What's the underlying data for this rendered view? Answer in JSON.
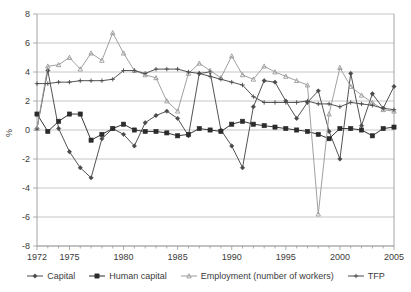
{
  "chart_data": {
    "type": "line",
    "title": "",
    "xlabel": "",
    "ylabel": "%",
    "xlim": [
      1972,
      2005
    ],
    "ylim": [
      -8,
      8
    ],
    "ytick_labels": [
      "8",
      "6",
      "4",
      "2",
      "0",
      "-2",
      "-4",
      "-6",
      "-8"
    ],
    "yticks": [
      8,
      6,
      4,
      2,
      0,
      -2,
      -4,
      -6,
      -8
    ],
    "xtick_labels": [
      "1972",
      "1975",
      "1980",
      "1985",
      "1990",
      "1995",
      "2000",
      "2005"
    ],
    "xticks": [
      1972,
      1975,
      1980,
      1985,
      1990,
      1995,
      2000,
      2005
    ],
    "grid": true,
    "legend_position": "bottom",
    "x": [
      1972,
      1973,
      1974,
      1975,
      1976,
      1977,
      1978,
      1979,
      1980,
      1981,
      1982,
      1983,
      1984,
      1985,
      1986,
      1987,
      1988,
      1989,
      1990,
      1991,
      1992,
      1993,
      1994,
      1995,
      1996,
      1997,
      1998,
      1999,
      2000,
      2001,
      2002,
      2003,
      2004,
      2005
    ],
    "series": [
      {
        "name": "Capital",
        "color": "#4a4a4a",
        "marker": "diamond",
        "values": [
          0.1,
          4.1,
          0.1,
          -1.5,
          -2.6,
          -3.3,
          -0.6,
          0.1,
          -0.3,
          -1.1,
          0.5,
          1.0,
          1.3,
          0.8,
          -0.4,
          3.9,
          4.0,
          0.0,
          -1.1,
          -2.6,
          1.6,
          3.4,
          3.3,
          2.0,
          0.8,
          1.9,
          2.7,
          -0.1,
          -2.0,
          3.9,
          0.3,
          2.5,
          1.5,
          3.0
        ]
      },
      {
        "name": "Human capital",
        "color": "#2b2b2b",
        "marker": "square",
        "values": [
          1.1,
          -0.1,
          0.6,
          1.1,
          1.1,
          -0.7,
          -0.3,
          0.1,
          0.4,
          0.0,
          -0.1,
          -0.1,
          -0.2,
          -0.4,
          -0.3,
          0.1,
          0.0,
          -0.1,
          0.4,
          0.6,
          0.4,
          0.3,
          0.2,
          0.1,
          0.0,
          -0.1,
          -0.3,
          -0.6,
          0.1,
          0.1,
          0.0,
          -0.4,
          0.1,
          0.2
        ]
      },
      {
        "name": "Employment (number of workers)",
        "color": "#9b9b9b",
        "marker": "triangle",
        "values": [
          0.1,
          4.4,
          4.5,
          5.0,
          4.2,
          5.3,
          4.8,
          6.7,
          5.3,
          4.1,
          3.8,
          3.6,
          2.0,
          1.3,
          3.9,
          4.6,
          4.1,
          3.6,
          5.1,
          3.8,
          3.5,
          4.4,
          4.0,
          3.7,
          3.4,
          3.1,
          -5.8,
          1.1,
          4.3,
          3.0,
          2.4,
          1.9,
          1.4,
          1.3
        ]
      },
      {
        "name": "TFP",
        "color": "#4a4a4a",
        "marker": "cross",
        "values": [
          3.2,
          3.2,
          3.3,
          3.3,
          3.4,
          3.4,
          3.4,
          3.5,
          4.1,
          4.1,
          3.9,
          4.2,
          4.2,
          4.2,
          4.0,
          3.9,
          3.7,
          3.5,
          3.3,
          3.1,
          2.3,
          1.9,
          1.9,
          1.9,
          1.9,
          2.0,
          1.8,
          1.8,
          1.6,
          1.9,
          1.8,
          1.7,
          1.5,
          1.4
        ]
      }
    ]
  },
  "legend": {
    "items": [
      {
        "label": "Capital"
      },
      {
        "label": "Human capital"
      },
      {
        "label": "Employment (number of workers)"
      },
      {
        "label": "TFP"
      }
    ]
  },
  "colors": {
    "capital": "#4a4a4a",
    "human_capital": "#2b2b2b",
    "employment": "#9b9b9b",
    "tfp": "#4a4a4a",
    "grid": "#b8b8b8",
    "axis": "#9a9a9a",
    "text": "#3b3b3b",
    "background": "#ffffff"
  }
}
